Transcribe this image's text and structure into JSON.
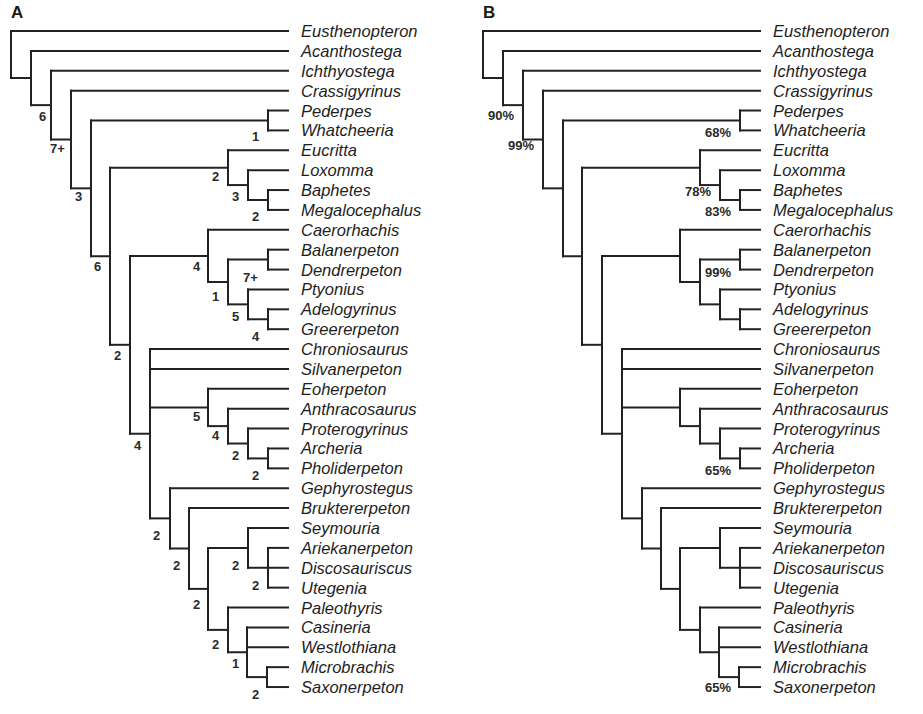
{
  "figure": {
    "row_top": 31,
    "row_spacing": 19.88,
    "tip_x": 288,
    "text_gap": 13,
    "colors": {
      "line": "#222222",
      "text": "#1e1e1e",
      "background": "#ffffff"
    }
  },
  "taxa": [
    "Eusthenopteron",
    "Acanthostega",
    "Ichthyostega",
    "Crassigyrinus",
    "Pederpes",
    "Whatcheeria",
    "Eucritta",
    "Loxomma",
    "Baphetes",
    "Megalocephalus",
    "Caerorhachis",
    "Balanerpeton",
    "Dendrerpeton",
    "Ptyonius",
    "Adelogyrinus",
    "Greererpeton",
    "Chroniosaurus",
    "Silvanerpeton",
    "Eoherpeton",
    "Anthracosaurus",
    "Proterogyrinus",
    "Archeria",
    "Pholiderpeton",
    "Gephyrostegus",
    "Bruktererpeton",
    "Seymouria",
    "Ariekanerpeton",
    "Discosauriscus",
    "Utegenia",
    "Paleothyris",
    "Casineria",
    "Westlothiana",
    "Microbrachis",
    "Saxonerpeton"
  ],
  "tree": {
    "id": "root",
    "x": 11,
    "children": [
      {
        "tip": 0
      },
      {
        "id": "n1",
        "x": 31,
        "children": [
          {
            "tip": 1
          },
          {
            "id": "n2",
            "x": 51,
            "children": [
              {
                "tip": 2
              },
              {
                "id": "n3",
                "x": 71,
                "children": [
                  {
                    "tip": 3
                  },
                  {
                    "id": "n4",
                    "x": 91,
                    "children": [
                      {
                        "id": "nPW",
                        "x": 268,
                        "children": [
                          {
                            "tip": 4
                          },
                          {
                            "tip": 5
                          }
                        ]
                      },
                      {
                        "id": "n5",
                        "x": 110,
                        "children": [
                          {
                            "id": "nEuc",
                            "x": 228,
                            "children": [
                              {
                                "tip": 6
                              },
                              {
                                "id": "nLox",
                                "x": 248,
                                "children": [
                                  {
                                    "tip": 7
                                  },
                                  {
                                    "id": "nBap",
                                    "x": 268,
                                    "children": [
                                      {
                                        "tip": 8
                                      },
                                      {
                                        "tip": 9
                                      }
                                    ]
                                  }
                                ]
                              }
                            ]
                          },
                          {
                            "id": "n6",
                            "x": 130,
                            "children": [
                              {
                                "id": "nCae",
                                "x": 208,
                                "children": [
                                  {
                                    "tip": 10
                                  },
                                  {
                                    "id": "nCae2",
                                    "x": 228,
                                    "children": [
                                      {
                                        "id": "nBal",
                                        "x": 268,
                                        "children": [
                                          {
                                            "tip": 11
                                          },
                                          {
                                            "tip": 12
                                          }
                                        ]
                                      },
                                      {
                                        "id": "nPty",
                                        "x": 248,
                                        "children": [
                                          {
                                            "tip": 13
                                          },
                                          {
                                            "id": "nAde",
                                            "x": 268,
                                            "children": [
                                              {
                                                "tip": 14
                                              },
                                              {
                                                "tip": 15
                                              }
                                            ]
                                          }
                                        ]
                                      }
                                    ]
                                  }
                                ]
                              },
                              {
                                "id": "n7",
                                "x": 150,
                                "children": [
                                  {
                                    "tip": 16
                                  },
                                  {
                                    "tip": 17
                                  },
                                  {
                                    "id": "nEoh",
                                    "x": 208,
                                    "children": [
                                      {
                                        "tip": 18
                                      },
                                      {
                                        "id": "nAnt",
                                        "x": 228,
                                        "children": [
                                          {
                                            "tip": 19
                                          },
                                          {
                                            "id": "nPro",
                                            "x": 248,
                                            "children": [
                                              {
                                                "tip": 20
                                              },
                                              {
                                                "id": "nArc",
                                                "x": 268,
                                                "children": [
                                                  {
                                                    "tip": 21
                                                  },
                                                  {
                                                    "tip": 22
                                                  }
                                                ]
                                              }
                                            ]
                                          }
                                        ]
                                      }
                                    ]
                                  },
                                  {
                                    "id": "nGep",
                                    "x": 170,
                                    "children": [
                                      {
                                        "tip": 23
                                      },
                                      {
                                        "id": "nBru",
                                        "x": 189,
                                        "children": [
                                          {
                                            "tip": 24
                                          },
                                          {
                                            "id": "nAmn",
                                            "x": 208,
                                            "children": [
                                              {
                                                "id": "nSey",
                                                "x": 248,
                                                "children": [
                                                  {
                                                    "tip": 25
                                                  },
                                                  {
                                                    "id": "nAri",
                                                    "x": 268,
                                                    "children": [
                                                      {
                                                        "tip": 26
                                                      },
                                                      {
                                                        "tip": 27
                                                      },
                                                      {
                                                        "tip": 28
                                                      }
                                                    ]
                                                  }
                                                ]
                                              },
                                              {
                                                "id": "nPal",
                                                "x": 228,
                                                "children": [
                                                  {
                                                    "tip": 29
                                                  },
                                                  {
                                                    "id": "nCas",
                                                    "x": 247,
                                                    "children": [
                                                      {
                                                        "tip": 30
                                                      },
                                                      {
                                                        "tip": 31
                                                      },
                                                      {
                                                        "id": "nMic",
                                                        "x": 267,
                                                        "children": [
                                                          {
                                                            "tip": 32
                                                          },
                                                          {
                                                            "tip": 33
                                                          }
                                                        ]
                                                      }
                                                    ]
                                                  }
                                                ]
                                              }
                                            ]
                                          }
                                        ]
                                      }
                                    ]
                                  }
                                ]
                              }
                            ]
                          }
                        ]
                      }
                    ]
                  }
                ]
              }
            ]
          }
        ]
      }
    ]
  },
  "panels": [
    {
      "letter": "A",
      "letter_pos": [
        11,
        18
      ],
      "offset_x": 0,
      "support_type": "Bremer decay index",
      "support_labels": [
        {
          "node": "n1",
          "text": "6",
          "x": 39,
          "y": 121
        },
        {
          "node": "n2",
          "text": "7+",
          "x": 50,
          "y": 153
        },
        {
          "node": "n3",
          "text": "3",
          "x": 75,
          "y": 201
        },
        {
          "node": "n4",
          "text": "6",
          "x": 94,
          "y": 271
        },
        {
          "node": "n5",
          "text": "2",
          "x": 114,
          "y": 360
        },
        {
          "node": "n6",
          "text": "4",
          "x": 134,
          "y": 450
        },
        {
          "node": "nPW",
          "text": "1",
          "x": 252,
          "y": 141
        },
        {
          "node": "nEuc",
          "text": "2",
          "x": 212,
          "y": 181
        },
        {
          "node": "nLox",
          "text": "3",
          "x": 232,
          "y": 201
        },
        {
          "node": "nBap",
          "text": "2",
          "x": 252,
          "y": 221
        },
        {
          "node": "nCae",
          "text": "4",
          "x": 193,
          "y": 271
        },
        {
          "node": "nCae2",
          "text": "1",
          "x": 212,
          "y": 301
        },
        {
          "node": "nBal",
          "text": "7+",
          "x": 243,
          "y": 282
        },
        {
          "node": "nPty",
          "text": "5",
          "x": 232,
          "y": 321
        },
        {
          "node": "nAde",
          "text": "4",
          "x": 252,
          "y": 341
        },
        {
          "node": "nEoh",
          "text": "5",
          "x": 193,
          "y": 421
        },
        {
          "node": "nAnt",
          "text": "4",
          "x": 212,
          "y": 440
        },
        {
          "node": "nPro",
          "text": "2",
          "x": 232,
          "y": 460
        },
        {
          "node": "nArc",
          "text": "2",
          "x": 252,
          "y": 480
        },
        {
          "node": "n7",
          "text": "2",
          "x": 153,
          "y": 540
        },
        {
          "node": "nGep",
          "text": "2",
          "x": 173,
          "y": 570
        },
        {
          "node": "nBru",
          "text": "2",
          "x": 193,
          "y": 609
        },
        {
          "node": "nSey",
          "text": "2",
          "x": 232,
          "y": 570
        },
        {
          "node": "nAri",
          "text": "2",
          "x": 252,
          "y": 590
        },
        {
          "node": "nAmn",
          "text": "2",
          "x": 212,
          "y": 649
        },
        {
          "node": "nCas",
          "text": "1",
          "x": 232,
          "y": 668
        },
        {
          "node": "nMic",
          "text": "2",
          "x": 252,
          "y": 699
        }
      ]
    },
    {
      "letter": "B",
      "letter_pos": [
        483,
        18
      ],
      "offset_x": 472,
      "support_type": "Bootstrap percentage",
      "support_labels": [
        {
          "node": "n1",
          "text": "90%",
          "x": 488,
          "y": 120
        },
        {
          "node": "n2",
          "text": "99%",
          "x": 508,
          "y": 150
        },
        {
          "node": "nPW",
          "text": "68%",
          "x": 705,
          "y": 137
        },
        {
          "node": "nLox",
          "text": "78%",
          "x": 685,
          "y": 196
        },
        {
          "node": "nBap",
          "text": "83%",
          "x": 705,
          "y": 216
        },
        {
          "node": "nCae2",
          "text": "99%",
          "x": 705,
          "y": 277
        },
        {
          "node": "nArc",
          "text": "65%",
          "x": 705,
          "y": 475
        },
        {
          "node": "nMic",
          "text": "65%",
          "x": 705,
          "y": 692
        }
      ]
    }
  ]
}
